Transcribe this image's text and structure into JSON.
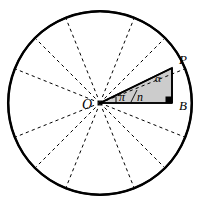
{
  "figure": {
    "labels": {
      "center": "O",
      "vertex": "P",
      "foot": "B",
      "angle_at_vertex": "α",
      "central_half_angle_numerator": "π",
      "central_half_angle_denominator": "n",
      "central_half_angle": "π/n"
    },
    "colors": {
      "stroke": "#000000",
      "shaded_triangle_fill": "#cccccc",
      "background": "#ffffff",
      "dashed_stroke": "#000000",
      "right_angle_marker": "#000000"
    },
    "geometry": {
      "circle_center_x": 100,
      "circle_center_y": 103,
      "circle_radius": 92,
      "num_vertices": 8,
      "vertex_start_angle_deg": -22.5,
      "arc_bulge": "inward",
      "dashed_radii_count": 8,
      "point_P_x": 172,
      "point_P_y": 68,
      "point_B_x": 172,
      "point_B_y": 103,
      "triangle_vertices": "O, P, B",
      "right_angle_at": "B"
    }
  }
}
